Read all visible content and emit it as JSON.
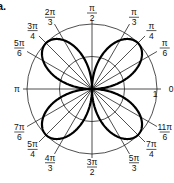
{
  "figure": {
    "part_label": "a."
  },
  "chart_data": {
    "type": "polar-line",
    "title": "",
    "equation": "r = sin 2θ (four-leaved rose)",
    "series": [
      {
        "name": "rose curve",
        "theta_samples_deg": [
          0,
          15,
          30,
          45,
          60,
          75,
          90,
          105,
          120,
          135,
          150,
          165,
          180,
          195,
          210,
          225,
          240,
          255,
          270,
          285,
          300,
          315,
          330,
          345,
          360
        ],
        "r_values": [
          0,
          0.5,
          0.866,
          1,
          0.866,
          0.5,
          0,
          0.5,
          0.866,
          1,
          0.866,
          0.5,
          0,
          0.5,
          0.866,
          1,
          0.866,
          0.5,
          0,
          0.5,
          0.866,
          1,
          0.866,
          0.5,
          0
        ]
      }
    ],
    "radial_circles": [
      0.5,
      1
    ],
    "radial_tick_label": "1",
    "angle_labels": [
      {
        "deg": 0,
        "num": "0",
        "den": ""
      },
      {
        "deg": 30,
        "num": "π",
        "den": "6"
      },
      {
        "deg": 45,
        "num": "π",
        "den": "4"
      },
      {
        "deg": 60,
        "num": "π",
        "den": "3"
      },
      {
        "deg": 90,
        "num": "π",
        "den": "2"
      },
      {
        "deg": 120,
        "num": "2π",
        "den": "3"
      },
      {
        "deg": 135,
        "num": "3π",
        "den": "4"
      },
      {
        "deg": 150,
        "num": "5π",
        "den": "6"
      },
      {
        "deg": 180,
        "num": "π",
        "den": ""
      },
      {
        "deg": 210,
        "num": "7π",
        "den": "6"
      },
      {
        "deg": 225,
        "num": "5π",
        "den": "4"
      },
      {
        "deg": 240,
        "num": "4π",
        "den": "3"
      },
      {
        "deg": 270,
        "num": "3π",
        "den": "2"
      },
      {
        "deg": 300,
        "num": "5π",
        "den": "3"
      },
      {
        "deg": 315,
        "num": "7π",
        "den": "4"
      },
      {
        "deg": 330,
        "num": "11π",
        "den": "6"
      }
    ],
    "grid": true,
    "legend": "none"
  }
}
